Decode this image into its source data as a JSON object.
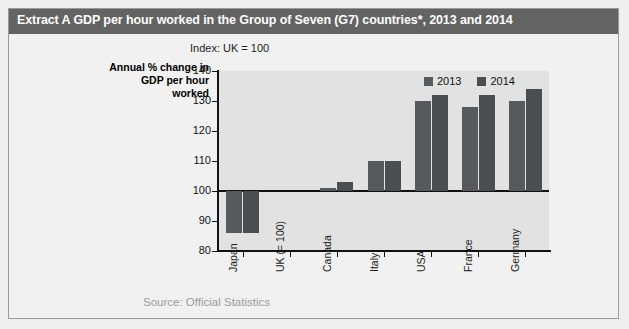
{
  "title": "Extract A GDP per hour worked in the Group of Seven (G7) countries*, 2013 and 2014",
  "index_note": "Index: UK = 100",
  "axis_title": "Annual % change in GDP per hour worked",
  "source": "Source: Official Statistics",
  "legend": [
    {
      "label": "2013",
      "color": "#58595b"
    },
    {
      "label": "2014",
      "color": "#4c4d4f"
    }
  ],
  "chart_data": {
    "type": "bar",
    "title": "Extract A GDP per hour worked in the Group of Seven (G7) countries*, 2013 and 2014",
    "subtitle": "Index: UK = 100",
    "xlabel": "",
    "ylabel": "Annual % change in GDP per hour worked",
    "ylim": [
      80,
      140
    ],
    "yticks": [
      80,
      90,
      100,
      110,
      120,
      130,
      140
    ],
    "baseline": 100,
    "grid": false,
    "legend_position": "top-right",
    "categories": [
      "Japan",
      "UK (= 100)",
      "Canada",
      "Italy",
      "USA",
      "France",
      "Germany"
    ],
    "series": [
      {
        "name": "2013",
        "color": "#58595b",
        "values": [
          86,
          100,
          101,
          110,
          130,
          128,
          130
        ]
      },
      {
        "name": "2014",
        "color": "#4c4d4f",
        "values": [
          86,
          100,
          103,
          110,
          132,
          132,
          134
        ]
      }
    ]
  }
}
